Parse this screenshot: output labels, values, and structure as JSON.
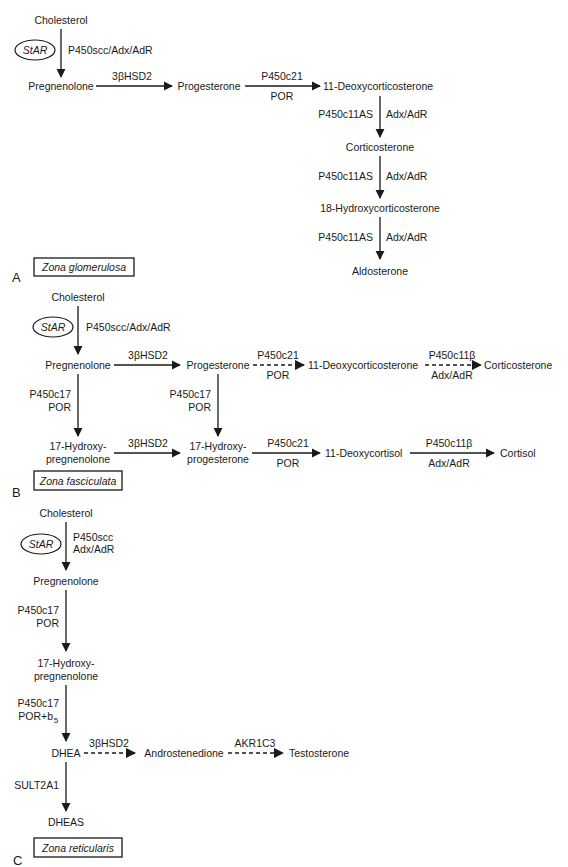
{
  "panel_a": {
    "letter": "A",
    "zone": "Zona glomerulosa",
    "cholesterol": "Cholesterol",
    "star": "StAR",
    "scc_enzyme": "P450scc/Adx/AdR",
    "pregnenolone": "Pregnenolone",
    "hsd": "3βHSD2",
    "progesterone": "Progesterone",
    "c21": "P450c21",
    "c21_cofactor": "POR",
    "doc": "11-Deoxycorticosterone",
    "c11as_1": "P450c11AS",
    "adx_1": "Adx/AdR",
    "corticosterone": "Corticosterone",
    "c11as_2": "P450c11AS",
    "adx_2": "Adx/AdR",
    "hydroxycorticosterone": "18-Hydroxycorticosterone",
    "c11as_3": "P450c11AS",
    "adx_3": "Adx/AdR",
    "aldosterone": "Aldosterone"
  },
  "panel_b": {
    "letter": "B",
    "zone": "Zona fasciculata",
    "cholesterol": "Cholesterol",
    "star": "StAR",
    "scc_enzyme": "P450scc/Adx/AdR",
    "pregnenolone": "Pregnenolone",
    "hsd_1": "3βHSD2",
    "progesterone": "Progesterone",
    "c21_1": "P450c21",
    "c21_1_cofactor": "POR",
    "doc": "11-Deoxycorticosterone",
    "c11b_1": "P450c11β",
    "c11b_1_cofactor": "Adx/AdR",
    "corticosterone": "Corticosterone",
    "c17_1": "P450c17",
    "c17_1_cofactor": "POR",
    "c17_2": "P450c17",
    "c17_2_cofactor": "POR",
    "oh_preg_1": "17-Hydroxy-",
    "oh_preg_2": "pregnenolone",
    "hsd_2": "3βHSD2",
    "oh_prog_1": "17-Hydroxy-",
    "oh_prog_2": "progesterone",
    "c21_2": "P450c21",
    "c21_2_cofactor": "POR",
    "deoxycortisol": "11-Deoxycortisol",
    "c11b_2": "P450c11β",
    "c11b_2_cofactor": "Adx/AdR",
    "cortisol": "Cortisol"
  },
  "panel_c": {
    "letter": "C",
    "zone": "Zona reticularis",
    "cholesterol": "Cholesterol",
    "star": "StAR",
    "scc_enzyme_1": "P450scc",
    "scc_enzyme_2": "Adx/AdR",
    "pregnenolone": "Pregnenolone",
    "c17_1": "P450c17",
    "c17_1_cofactor": "POR",
    "oh_preg_1": "17-Hydroxy-",
    "oh_preg_2": "pregnenolone",
    "c17_2": "P450c17",
    "c17_2_cofactor": "POR+b",
    "c17_2_cofactor_sub": "5",
    "dhea": "DHEA",
    "hsd": "3βHSD2",
    "androstenedione": "Androstenedione",
    "akr": "AKR1C3",
    "testosterone": "Testosterone",
    "sult": "SULT2A1",
    "dheas": "DHEAS"
  }
}
